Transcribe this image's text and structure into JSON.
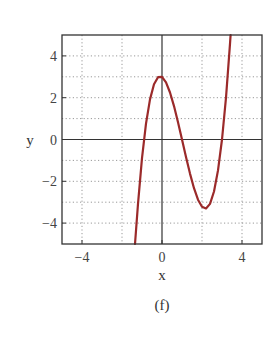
{
  "chart_data": {
    "type": "line",
    "title": "",
    "caption": "(f)",
    "xlabel": "x",
    "ylabel": "y",
    "xlim": [
      -5,
      5
    ],
    "ylim": [
      -5,
      5
    ],
    "xticks": [
      -4,
      0,
      4
    ],
    "yticks": [
      4,
      2,
      0,
      -2,
      -4
    ],
    "xtick_labels": [
      "−4",
      "0",
      "4"
    ],
    "ytick_labels": [
      "4",
      "2",
      "0",
      "−2",
      "−4"
    ],
    "grid": true,
    "grid_x": [
      -4,
      -2,
      2,
      4
    ],
    "grid_y": [
      4,
      3,
      2,
      1,
      -1,
      -2,
      -3,
      -4
    ],
    "legend": null,
    "series": [
      {
        "name": "f(x)",
        "color": "#9b2a2a",
        "x": [
          -1.35,
          -1.2,
          -1.0,
          -0.8,
          -0.6,
          -0.4,
          -0.2,
          0.0,
          0.2,
          0.4,
          0.6,
          0.8,
          1.0,
          1.2,
          1.4,
          1.6,
          1.8,
          2.0,
          2.2,
          2.4,
          2.6,
          2.8,
          3.0,
          3.2,
          3.4,
          3.43
        ],
        "y": [
          -5.0,
          -3.08,
          -0.89,
          0.76,
          1.92,
          2.64,
          2.98,
          3.0,
          2.73,
          2.25,
          1.6,
          0.83,
          0.0,
          -0.84,
          -1.63,
          -2.33,
          -2.88,
          -3.22,
          -3.3,
          -3.08,
          -2.49,
          -1.48,
          0.0,
          2.0,
          4.58,
          5.0
        ]
      }
    ]
  },
  "labels": {
    "xlabel": "x",
    "ylabel": "y",
    "caption": "(f)"
  }
}
